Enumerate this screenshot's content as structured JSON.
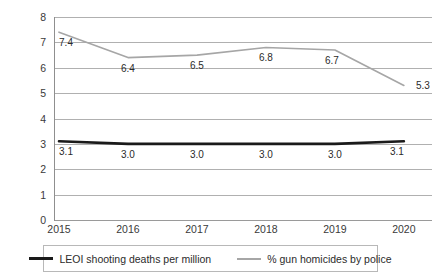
{
  "chart_data": {
    "type": "line",
    "title": "",
    "xlabel": "",
    "ylabel": "",
    "categories": [
      "2015",
      "2016",
      "2017",
      "2018",
      "2019",
      "2020"
    ],
    "ylim": [
      0,
      8
    ],
    "y_ticks": [
      "0",
      "1",
      "2",
      "3",
      "4",
      "5",
      "6",
      "7",
      "8"
    ],
    "grid": true,
    "legend_position": "bottom",
    "series": [
      {
        "name": "LEOI shooting deaths per million",
        "color": "#1a1a1a",
        "values": [
          3.1,
          3.0,
          3.0,
          3.0,
          3.0,
          3.1
        ],
        "labels": [
          "3.1",
          "3.0",
          "3.0",
          "3.0",
          "3.0",
          "3.1"
        ]
      },
      {
        "name": "% gun homicides by police",
        "color": "#a6a6a6",
        "values": [
          7.4,
          6.4,
          6.5,
          6.8,
          6.7,
          5.3
        ],
        "labels": [
          "7.4",
          "6.4",
          "6.5",
          "6.8",
          "6.7",
          "5.3"
        ]
      }
    ]
  },
  "legend": {
    "entries": [
      {
        "label": "LEOI shooting deaths per million"
      },
      {
        "label": "% gun homicides by police"
      }
    ]
  }
}
